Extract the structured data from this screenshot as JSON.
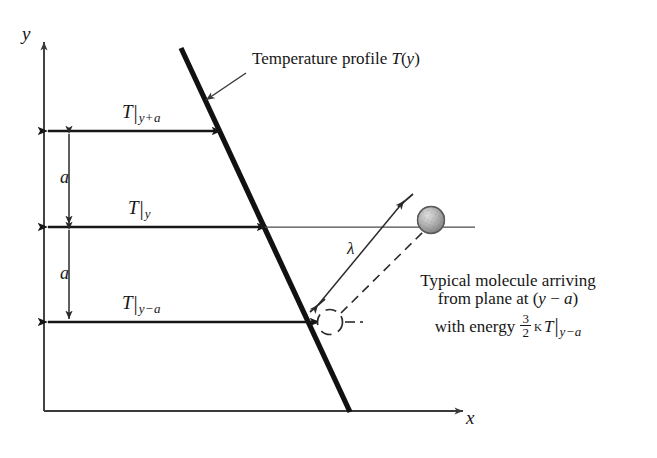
{
  "figure": {
    "type": "physics-schematic",
    "background_color": "#ffffff",
    "ink_color": "#161616"
  },
  "axes": {
    "y_label": "y",
    "x_label": "x",
    "origin": {
      "x": 44,
      "y": 411
    }
  },
  "annotations": {
    "profile_label": "Temperature profile T(y)",
    "profile_label_math_italic": "T(y)",
    "lambda_label": "λ"
  },
  "level_labels": [
    {
      "name": "T-at-y-plus-a",
      "symbol": "T",
      "bar": "|",
      "sub_var": "y",
      "sub_op": "+",
      "sub_off": "a"
    },
    {
      "name": "T-at-y",
      "symbol": "T",
      "bar": "|",
      "sub_var": "y",
      "sub_op": "",
      "sub_off": ""
    },
    {
      "name": "T-at-y-minus-a",
      "symbol": "T",
      "bar": "|",
      "sub_var": "y",
      "sub_op": "−",
      "sub_off": "a"
    }
  ],
  "spacing_labels": [
    {
      "name": "spacing-upper",
      "text": "a"
    },
    {
      "name": "spacing-lower",
      "text": "a"
    }
  ],
  "molecule_caption": {
    "line1": "Typical molecule arriving",
    "line2_pre": "from plane at (",
    "line2_var": "y",
    "line2_op": " − ",
    "line2_off": "a",
    "line2_post": ")",
    "line3_pre": "with energy ",
    "frac_num": "3",
    "frac_den": "2",
    "kappa": "κ",
    "T": "T",
    "bar": "|",
    "sub_var": "y",
    "sub_op": "−",
    "sub_off": "a"
  }
}
